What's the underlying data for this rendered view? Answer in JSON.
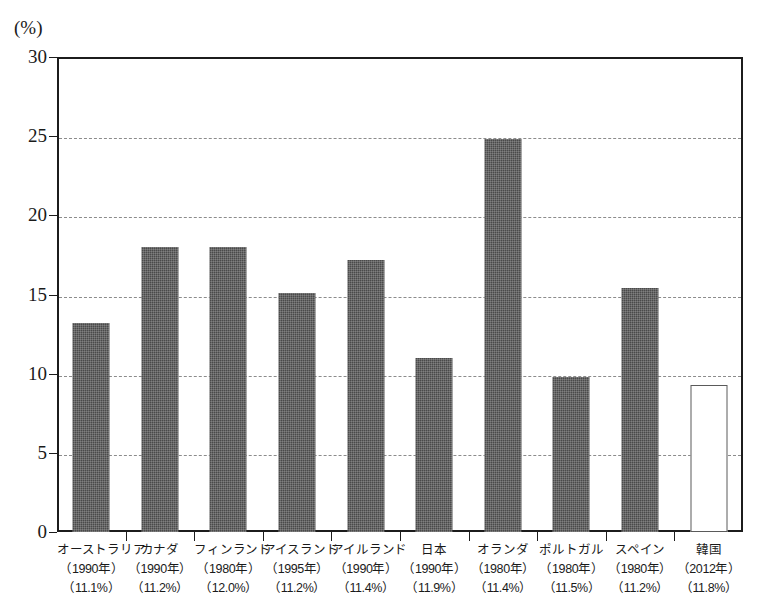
{
  "chart_data": {
    "type": "bar",
    "title": "",
    "subtitle": "",
    "xlabel": "",
    "ylabel": "",
    "unit_label": "(%)",
    "ylim": [
      0,
      30
    ],
    "ytick_step": 5,
    "yticks": [
      "0",
      "5",
      "10",
      "15",
      "20",
      "25",
      "30"
    ],
    "grid": true,
    "grid_style": "dashed-horizontal",
    "legend": "none",
    "categories": [
      "オーストラリア",
      "カナダ",
      "フィンランド",
      "アイスランド",
      "アイルランド",
      "日本",
      "オランダ",
      "ポルトガル",
      "スペイン",
      "韓国"
    ],
    "values": [
      13.2,
      18.0,
      18.0,
      15.1,
      17.2,
      11.0,
      24.8,
      9.8,
      15.4,
      9.3
    ],
    "bars": [
      {
        "category": "オーストラリア",
        "year_label": "（1990年）",
        "rate_label": "（11.1%）",
        "value": 13.2,
        "style": "filled"
      },
      {
        "category": "カナダ",
        "year_label": "（1990年）",
        "rate_label": "（11.2%）",
        "value": 18.0,
        "style": "filled"
      },
      {
        "category": "フィンランド",
        "year_label": "（1980年）",
        "rate_label": "（12.0%）",
        "value": 18.0,
        "style": "filled"
      },
      {
        "category": "アイスランド",
        "year_label": "（1995年）",
        "rate_label": "（11.2%）",
        "value": 15.1,
        "style": "filled"
      },
      {
        "category": "アイルランド",
        "year_label": "（1990年）",
        "rate_label": "（11.4%）",
        "value": 17.2,
        "style": "filled"
      },
      {
        "category": "日本",
        "year_label": "（1990年）",
        "rate_label": "（11.9%）",
        "value": 11.0,
        "style": "filled"
      },
      {
        "category": "オランダ",
        "year_label": "（1980年）",
        "rate_label": "（11.4%）",
        "value": 24.8,
        "style": "filled"
      },
      {
        "category": "ポルトガル",
        "year_label": "（1980年）",
        "rate_label": "（11.5%）",
        "value": 9.8,
        "style": "filled"
      },
      {
        "category": "スペイン",
        "year_label": "（1980年）",
        "rate_label": "（11.2%）",
        "value": 15.4,
        "style": "filled"
      },
      {
        "category": "韓国",
        "year_label": "（2012年）",
        "rate_label": "（11.8%）",
        "value": 9.3,
        "style": "hollow"
      }
    ],
    "colors": {
      "bar_fill": "#4a4a4a",
      "bar_highlight_fill": "#ffffff",
      "bar_highlight_stroke": "#5a5a5a",
      "axis": "#1c1c1c",
      "gridline": "#8c8c8c",
      "background": "#ffffff",
      "text": "#1a1a1a"
    }
  }
}
